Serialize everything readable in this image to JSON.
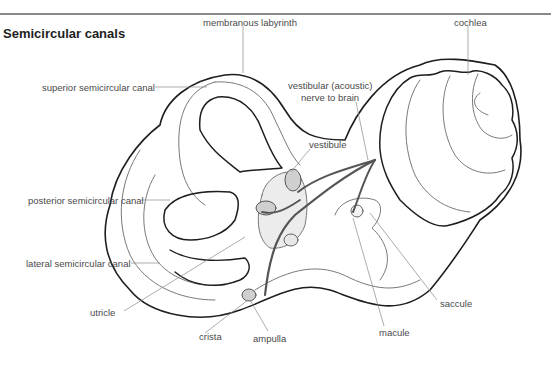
{
  "title": "Semicircular canals",
  "labels": {
    "membranous_labyrinth": "membranous labyrinth",
    "cochlea": "cochlea",
    "vestibular_nerve_line1": "vestibular (acoustic)",
    "vestibular_nerve_line2": "nerve to brain",
    "superior_canal": "superior semicircular canal",
    "vestibule": "vestibule",
    "posterior_canal": "posterior semicircular canal",
    "lateral_canal": "lateral semicircular canal",
    "saccule": "saccule",
    "utricle": "utricle",
    "macule": "macule",
    "crista": "crista",
    "ampulla": "ampulla"
  },
  "colors": {
    "outline": "#1e1e1e",
    "inner_line": "#6a6a6a",
    "leader": "#8a8a8a",
    "nerve": "#555555",
    "organ_fill": "#d8d8d8"
  }
}
